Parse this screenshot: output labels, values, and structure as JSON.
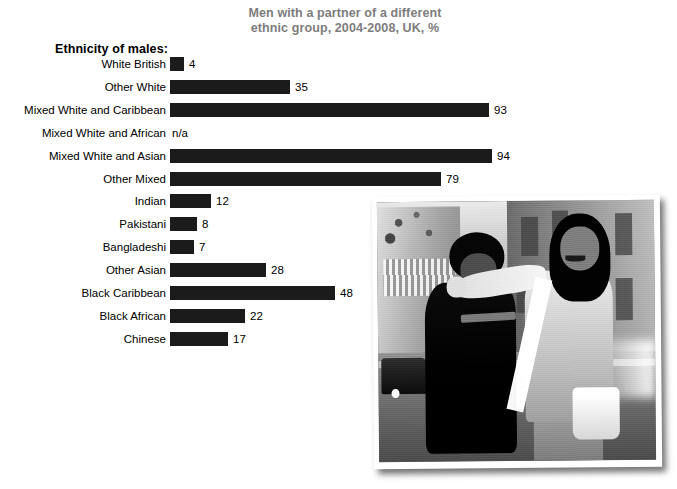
{
  "chart_data": {
    "type": "bar",
    "orientation": "horizontal",
    "title": "Men with a partner of a different ethnic group, 2004-2008, UK, %",
    "title_lines": [
      "Men with a partner of a different",
      "ethnic group, 2004-2008, UK, %"
    ],
    "axis_header": "Ethnicity of males:",
    "xlabel": "",
    "ylabel": "",
    "grid": false,
    "legend": "none",
    "xlim": [
      0,
      100
    ],
    "bar_color": "#1b1b1b",
    "title_color": "#7d7d7d",
    "categories": [
      "White British",
      "Other White",
      "Mixed White and Caribbean",
      "Mixed White and African",
      "Mixed White and Asian",
      "Other Mixed",
      "Indian",
      "Pakistani",
      "Bangladeshi",
      "Other Asian",
      "Black Caribbean",
      "Black African",
      "Chinese"
    ],
    "values": [
      4,
      35,
      93,
      null,
      94,
      79,
      12,
      8,
      7,
      28,
      48,
      22,
      17
    ],
    "value_labels": [
      "4",
      "35",
      "93",
      "n/a",
      "94",
      "79",
      "12",
      "8",
      "7",
      "28",
      "48",
      "22",
      "17"
    ],
    "missing_label": "n/a"
  },
  "photo": {
    "alt": "Black and white street photograph of a couple walking arm in arm",
    "caption": ""
  }
}
